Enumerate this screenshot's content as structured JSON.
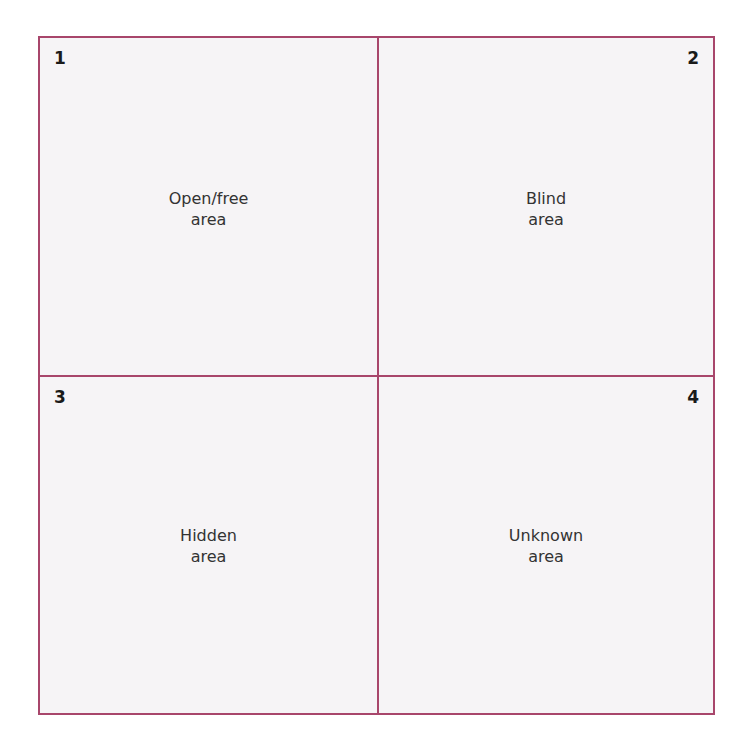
{
  "quadrants": [
    {
      "number": "1",
      "line1": "Open/free",
      "line2": "area"
    },
    {
      "number": "2",
      "line1": "Blind",
      "line2": "area"
    },
    {
      "number": "3",
      "line1": "Hidden",
      "line2": "area"
    },
    {
      "number": "4",
      "line1": "Unknown",
      "line2": "area"
    }
  ],
  "colors": {
    "border": "#a8466b",
    "fill": "#f6f4f6"
  }
}
